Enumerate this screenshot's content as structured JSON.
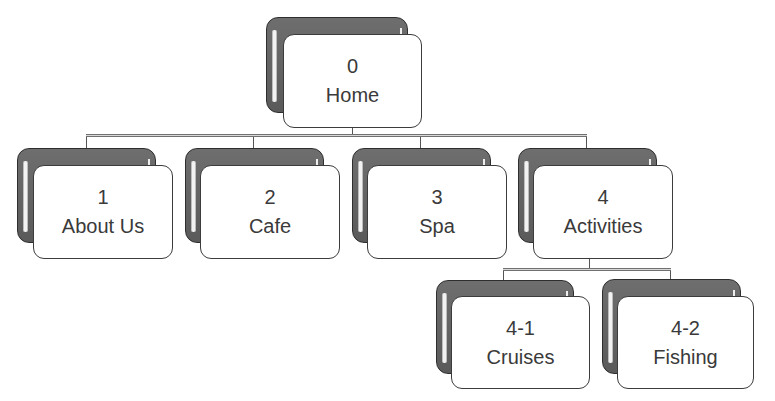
{
  "diagram": {
    "type": "site-map hierarchy",
    "nodes": {
      "home": {
        "number": "0",
        "label": "Home"
      },
      "about": {
        "number": "1",
        "label": "About Us"
      },
      "cafe": {
        "number": "2",
        "label": "Cafe"
      },
      "spa": {
        "number": "3",
        "label": "Spa"
      },
      "activities": {
        "number": "4",
        "label": "Activities"
      },
      "cruises": {
        "number": "4-1",
        "label": "Cruises"
      },
      "fishing": {
        "number": "4-2",
        "label": "Fishing"
      }
    },
    "edges": [
      {
        "from": "0",
        "to": "1"
      },
      {
        "from": "0",
        "to": "2"
      },
      {
        "from": "0",
        "to": "3"
      },
      {
        "from": "0",
        "to": "4"
      },
      {
        "from": "4",
        "to": "4-1"
      },
      {
        "from": "4",
        "to": "4-2"
      }
    ],
    "colors": {
      "back_card": "#626262",
      "front_card": "#ffffff",
      "border": "#3c3c3c",
      "text": "#3a3a3a",
      "connector": "#707070"
    }
  }
}
